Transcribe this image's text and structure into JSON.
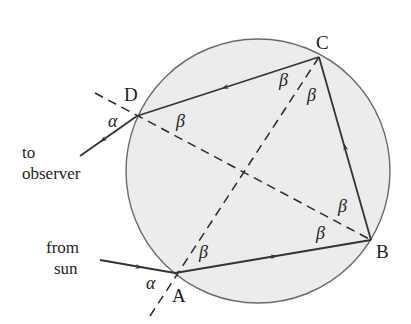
{
  "diagram": {
    "colors": {
      "background": "#ffffff",
      "droplet_fill": "#ececec",
      "droplet_stroke": "#6a6a6a",
      "ray": "#333333",
      "dashed": "#2a2a2a",
      "text": "#1e1e1e"
    },
    "circle": {
      "cx": 258,
      "cy": 171,
      "r": 132
    },
    "points": {
      "A": {
        "label": "A",
        "x": 175,
        "y": 273
      },
      "B": {
        "label": "B",
        "x": 371,
        "y": 240
      },
      "C": {
        "label": "C",
        "x": 319,
        "y": 57
      },
      "D": {
        "label": "D",
        "x": 137,
        "y": 116
      }
    },
    "angle_labels": {
      "alpha": "α",
      "beta": "β"
    },
    "text_labels": {
      "to_line1": "to",
      "to_line2": "observer",
      "from_line1": "from",
      "from_line2": "sun"
    },
    "rays": [
      {
        "name": "incoming-ray",
        "from": "sun",
        "to": "A"
      },
      {
        "name": "ray-AB",
        "from": "A",
        "to": "B"
      },
      {
        "name": "ray-BC",
        "from": "B",
        "to": "C"
      },
      {
        "name": "ray-CD",
        "from": "C",
        "to": "D"
      },
      {
        "name": "outgoing-ray",
        "from": "D",
        "to": "observer"
      }
    ],
    "normals": [
      {
        "name": "normal-DB",
        "through": [
          "D",
          "B"
        ]
      },
      {
        "name": "normal-AC",
        "through": [
          "A",
          "C"
        ]
      }
    ]
  }
}
